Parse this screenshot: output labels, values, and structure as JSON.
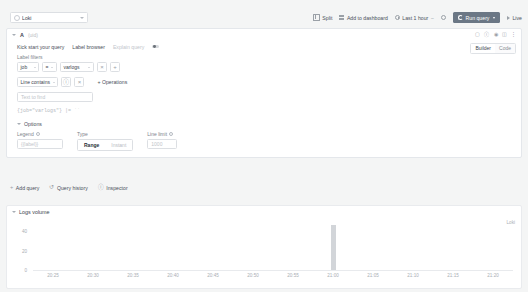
{
  "datasource": {
    "name": "Loki",
    "logo_icon": "loki-logo-icon",
    "chevron_icon": "chevron-down-icon"
  },
  "toolbar": {
    "split": {
      "label": "Split",
      "icon": "split-pane-icon"
    },
    "add_to_dashboard": {
      "label": "Add to dashboard",
      "icon": "dashboard-grid-icon"
    },
    "time_range": {
      "label": "Last 1 hour",
      "icon": "clock-icon",
      "separator": "~"
    },
    "zoom_out": {
      "icon": "zoom-out-icon"
    },
    "run_query": {
      "label": "Run query",
      "icon": "refresh-icon",
      "caret": "caret-down-icon"
    },
    "live": {
      "label": "Live",
      "icon": "play-icon"
    }
  },
  "query": {
    "collapse_icon": "caret-down-icon",
    "ref_id": "A",
    "uid": "(uid)",
    "header_icons": [
      "copy-icon",
      "info-icon",
      "eye-icon",
      "trash-icon",
      "drag-handle-icon"
    ],
    "kick_start": "Kick start your query",
    "label_browser": "Label browser",
    "explain_query": "Explain query",
    "explain_toggle_state": "off",
    "mode": {
      "builder": "Builder",
      "code": "Code",
      "selected": "Builder"
    },
    "label_filters": {
      "title": "Label filters",
      "filters": [
        {
          "key": "job",
          "operator": "=",
          "value": "varlogs"
        }
      ],
      "remove_label": "×",
      "add_label": "+"
    },
    "operations": {
      "line_filter_label": "Line contains",
      "line_filter_op": "",
      "remove_label": "×",
      "add_operations_label": "+ Operations",
      "text_input_placeholder": "Text to find",
      "text_input_value": ""
    },
    "preview": "{job=\"varlogs\"} |= ``",
    "options": {
      "title": "Options",
      "legend": {
        "label": "Legend",
        "placeholder": "{{label}}",
        "value": "",
        "info_icon": "info-icon"
      },
      "type": {
        "label": "Type",
        "range": "Range",
        "instant": "Instant",
        "selected": "Range"
      },
      "line_limit": {
        "label": "Line limit",
        "placeholder": "1000",
        "value": "",
        "info_icon": "info-icon"
      }
    }
  },
  "actions": {
    "add_query": {
      "label": "Add query",
      "icon": "plus-icon"
    },
    "query_history": {
      "label": "Query history",
      "icon": "history-icon"
    },
    "inspector": {
      "label": "Inspector",
      "icon": "inspector-icon"
    }
  },
  "logs_volume": {
    "title": "Logs volume",
    "collapse_icon": "caret-down-icon",
    "legend_label": "Loki"
  },
  "chart_data": {
    "type": "bar",
    "title": "Logs volume",
    "xlabel": "",
    "ylabel": "",
    "ylim": [
      0,
      50
    ],
    "yticks": [
      0,
      20,
      40
    ],
    "ytick_labels": [
      "0",
      "20",
      "40"
    ],
    "x": [
      "20:25",
      "20:30",
      "20:35",
      "20:40",
      "20:45",
      "20:50",
      "20:55",
      "21:00",
      "21:05",
      "21:10",
      "21:15",
      "21:20"
    ],
    "xtick_labels": [
      "20:25",
      "20:30",
      "20:35",
      "20:40",
      "20:45",
      "20:50",
      "20:55",
      "21:00",
      "21:05",
      "21:10",
      "21:15",
      "21:20"
    ],
    "series": [
      {
        "name": "Loki",
        "color": "#d2d5d9",
        "values": [
          0,
          0,
          0,
          0,
          0,
          0,
          0,
          47,
          0,
          0,
          0,
          0
        ]
      }
    ],
    "grid": false,
    "legend_position": "top-right"
  }
}
